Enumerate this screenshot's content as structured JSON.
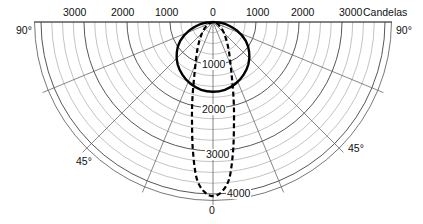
{
  "chart_data": {
    "type": "polar",
    "title": "",
    "unit_label": "Candelas",
    "radial_axis": {
      "ticks": [
        0,
        1000,
        2000,
        3000,
        4000
      ],
      "minor_step": 250,
      "max": 4150
    },
    "top_scale_labels": {
      "left": [
        "3000",
        "2000",
        "1000"
      ],
      "center": "0",
      "right": [
        "1000",
        "2000",
        "3000"
      ]
    },
    "angle_labels": {
      "left_90": "90°",
      "right_90": "90°",
      "left_45": "45°",
      "right_45": "45°",
      "bottom_0": "0"
    },
    "radial_lines_deg": [
      0,
      22.5,
      45,
      67.5,
      90
    ],
    "axis_value_labels": [
      "1000",
      "2000",
      "3000",
      "4000"
    ],
    "series": [
      {
        "name": "wide distribution (solid)",
        "style": "solid",
        "angles_deg": [
          0,
          10,
          20,
          30,
          40,
          50,
          60,
          70,
          80,
          85,
          90
        ],
        "values": [
          1620,
          1600,
          1530,
          1420,
          1280,
          1100,
          880,
          600,
          300,
          140,
          0
        ]
      },
      {
        "name": "narrow distribution (dashed)",
        "style": "dashed",
        "angles_deg": [
          0,
          3,
          6,
          9,
          12,
          15,
          20,
          30,
          45,
          60,
          75,
          90
        ],
        "values": [
          4050,
          3950,
          3650,
          3000,
          2350,
          1850,
          1250,
          720,
          360,
          170,
          60,
          0
        ]
      }
    ]
  }
}
